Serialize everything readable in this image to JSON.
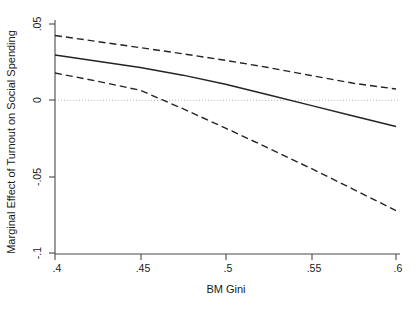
{
  "chart_data": {
    "type": "line",
    "title": "",
    "xlabel": "BM Gini",
    "ylabel": "Marginal Effect of Turnout on Social Spending",
    "xlim": [
      0.4,
      0.6
    ],
    "ylim": [
      -0.1,
      0.05
    ],
    "xticks": [
      0.4,
      0.45,
      0.5,
      0.55,
      0.6
    ],
    "xtick_labels": [
      ".4",
      ".45",
      ".5",
      ".55",
      ".6"
    ],
    "yticks": [
      0.05,
      0,
      -0.05,
      -0.1
    ],
    "ytick_labels": [
      ".05",
      "0",
      "-.05",
      "-.1"
    ],
    "grid": false,
    "legend": null,
    "zero_reference_line": {
      "value": 0,
      "style": "dotted",
      "color": "#b9b9b9"
    },
    "series": [
      {
        "name": "Marginal effect",
        "style": "solid",
        "color": "#242424",
        "x": [
          0.4,
          0.425,
          0.45,
          0.475,
          0.5,
          0.525,
          0.55,
          0.575,
          0.6
        ],
        "y": [
          0.0297,
          0.0256,
          0.0215,
          0.0165,
          0.0105,
          0.0037,
          -0.0033,
          -0.0103,
          -0.0172
        ]
      },
      {
        "name": "Upper 95% confidence bound",
        "style": "dashed",
        "color": "#242424",
        "x": [
          0.4,
          0.425,
          0.45,
          0.475,
          0.5,
          0.525,
          0.55,
          0.575,
          0.6
        ],
        "y": [
          0.0425,
          0.0385,
          0.0345,
          0.0305,
          0.0262,
          0.0215,
          0.0163,
          0.0112,
          0.0074
        ]
      },
      {
        "name": "Lower 95% confidence bound",
        "style": "dashed",
        "color": "#242424",
        "x": [
          0.4,
          0.425,
          0.45,
          0.475,
          0.5,
          0.525,
          0.55,
          0.575,
          0.6
        ],
        "y": [
          0.0179,
          0.0125,
          0.0066,
          -0.0055,
          -0.0182,
          -0.0312,
          -0.0445,
          -0.0583,
          -0.0722
        ]
      }
    ]
  },
  "axes": {
    "y_axis_label": "Marginal Effect of Turnout on Social Spending",
    "x_axis_label": "BM Gini",
    "y_tick_labels": [
      ".05",
      "0",
      "-.05",
      "-.1"
    ],
    "x_tick_labels": [
      ".4",
      ".45",
      ".5",
      ".55",
      ".6"
    ]
  }
}
